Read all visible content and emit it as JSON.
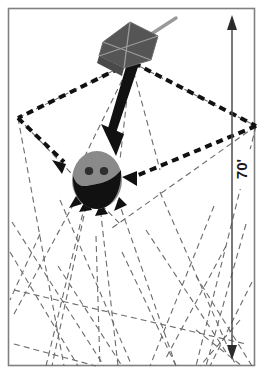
{
  "figure": {
    "caption": "",
    "border": {
      "name": "outer-frame",
      "color": "#808080",
      "x": 8,
      "y": 8,
      "width": 247,
      "height": 358
    },
    "dimension": {
      "label": "70'",
      "orientation": "vertical",
      "arrow_style": "double-headed",
      "color": "#4d4d4d",
      "x": 232,
      "y_top": 18,
      "y_bottom": 356
    },
    "satellite": {
      "name": "sensor-emitter-box",
      "body_color": "#555555",
      "edge_color": "#9a9a9a",
      "antenna_color": "#8c8c8c",
      "x": 128,
      "y": 45
    },
    "target": {
      "name": "target-head",
      "upper_color": "#8a8a8a",
      "lower_color": "#111111",
      "eye_color": "#333333",
      "x": 97,
      "y": 180,
      "rx": 25,
      "ry": 29
    },
    "main_arrow": {
      "name": "direct-path-arrow",
      "color": "#111111",
      "from_x": 131,
      "from_y": 62,
      "to_x": 104,
      "to_y": 152
    },
    "bold_dashed": {
      "name": "reflected-path",
      "color": "#111111",
      "stroke_width": 4,
      "dash": "7 5",
      "left_vertex_x": 18,
      "left_vertex_y": 118,
      "right_vertex_x": 256,
      "right_vertex_y": 126
    },
    "thin_dashed": {
      "name": "multipath-rays",
      "color": "#6b6b6b",
      "stroke_width": 1.1,
      "dash": "6 4"
    },
    "colors": {
      "background": "#ffffff",
      "frame": "#808080",
      "ink": "#111111",
      "gray": "#8a8a8a",
      "thin_line": "#6b6b6b"
    }
  }
}
